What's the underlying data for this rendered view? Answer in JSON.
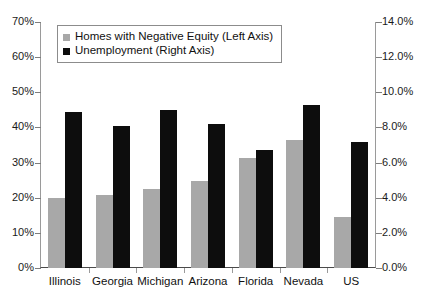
{
  "chart_data": {
    "type": "bar",
    "title": "",
    "subtitle": "",
    "xlabel": "",
    "categories": [
      "Illinois",
      "Georgia",
      "Michigan",
      "Arizona",
      "Florida",
      "Nevada",
      "US"
    ],
    "series": [
      {
        "name": "Homes with Negative Equity (Left Axis)",
        "axis": "left",
        "color": "#a8a8a8",
        "values": [
          20.0,
          20.7,
          22.5,
          24.8,
          31.3,
          36.3,
          14.4
        ]
      },
      {
        "name": "Unemployment (Right Axis)",
        "axis": "right",
        "color": "#0d0d0d",
        "values": [
          8.9,
          8.1,
          9.0,
          8.2,
          6.7,
          9.3,
          7.2
        ]
      }
    ],
    "left_axis": {
      "label": "",
      "ylim": [
        0,
        70
      ],
      "tick_step": 10,
      "tick_labels": [
        "0%",
        "10%",
        "20%",
        "30%",
        "40%",
        "50%",
        "60%",
        "70%"
      ]
    },
    "right_axis": {
      "label": "",
      "ylim": [
        0,
        14
      ],
      "tick_step": 2,
      "tick_labels": [
        "0.0%",
        "2.0%",
        "4.0%",
        "6.0%",
        "8.0%",
        "10.0%",
        "12.0%",
        "14.0%"
      ]
    },
    "grid": false,
    "legend_position": "top-left"
  }
}
